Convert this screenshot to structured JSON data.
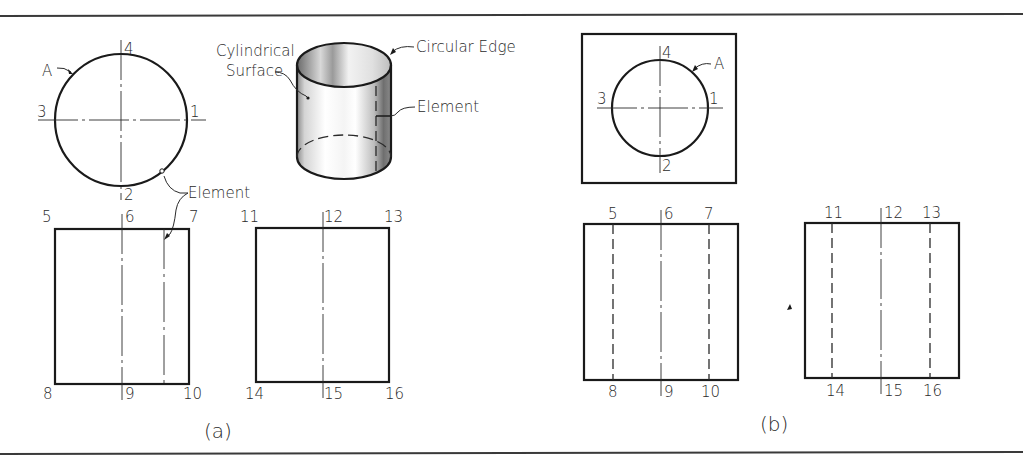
{
  "figure": {
    "colors": {
      "ink": "#1a1a1a",
      "background": "#ffffff",
      "frame": "#3a3a3a"
    },
    "part_a": {
      "caption": "(a)",
      "top_view": {
        "curve_label": "A",
        "points": [
          "1",
          "2",
          "3",
          "4"
        ]
      },
      "pictorial": {
        "labels": {
          "cylindrical_surface_line1": "Cylindrical",
          "cylindrical_surface_line2": "Surface",
          "circular_edge": "Circular Edge",
          "element": "Element"
        }
      },
      "element_callout": "Element",
      "front_view": {
        "points": [
          "5",
          "6",
          "7",
          "8",
          "9",
          "10"
        ]
      },
      "side_view": {
        "points": [
          "11",
          "12",
          "13",
          "14",
          "15",
          "16"
        ]
      }
    },
    "part_b": {
      "caption": "(b)",
      "top_view": {
        "curve_label": "A",
        "points": [
          "1",
          "2",
          "3",
          "4"
        ]
      },
      "front_view": {
        "points": [
          "5",
          "6",
          "7",
          "8",
          "9",
          "10"
        ]
      },
      "side_view": {
        "points": [
          "11",
          "12",
          "13",
          "14",
          "15",
          "16"
        ]
      }
    }
  }
}
